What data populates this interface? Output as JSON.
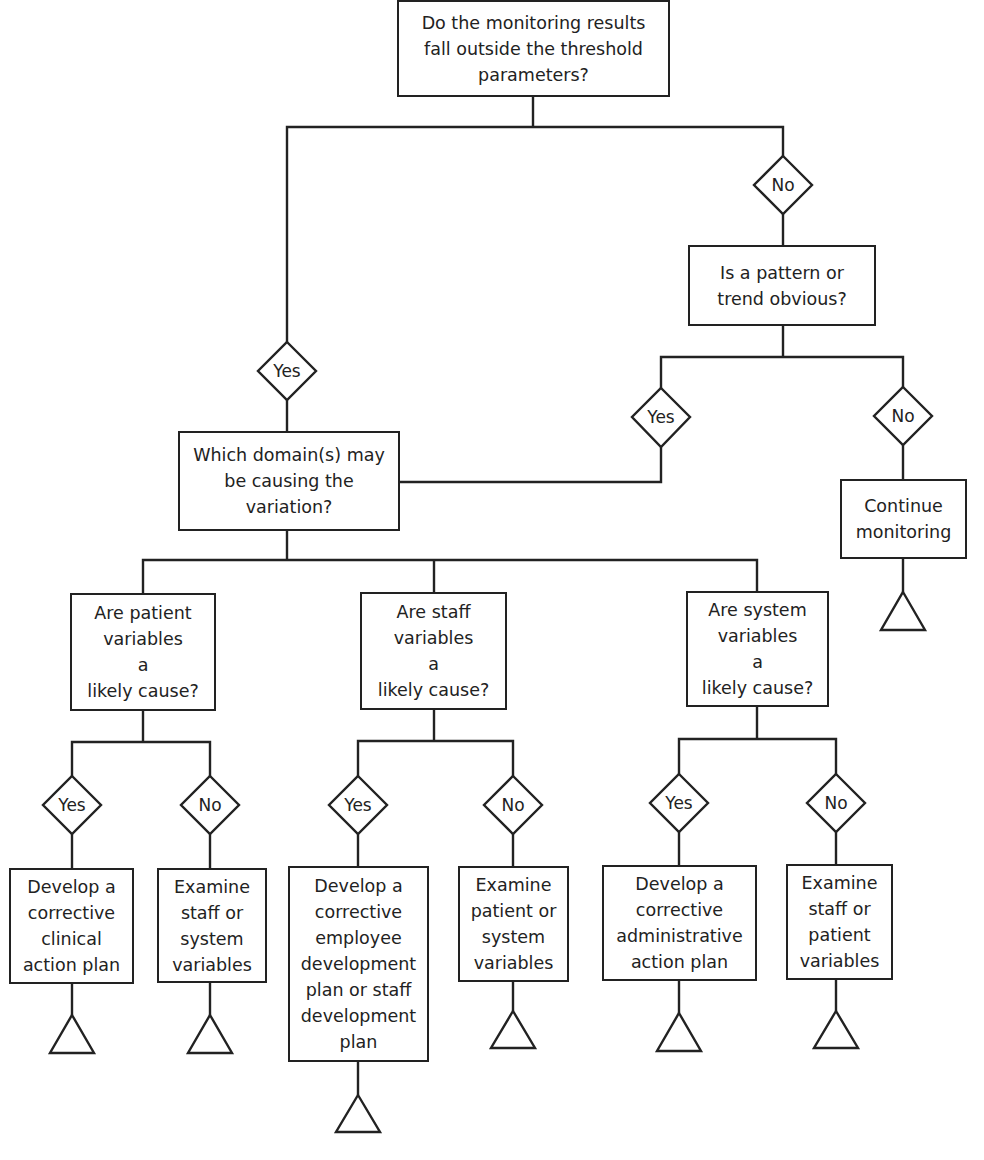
{
  "diagram": {
    "type": "decision-flowchart",
    "nodes": {
      "root": {
        "lines": [
          "Do the monitoring results",
          "fall outside the threshold",
          "parameters?"
        ]
      },
      "pattern": {
        "lines": [
          "Is a pattern or",
          "trend obvious?"
        ]
      },
      "domain": {
        "lines": [
          "Which domain(s) may",
          "be causing the",
          "variation?"
        ]
      },
      "continue": {
        "lines": [
          "Continue",
          "monitoring"
        ]
      },
      "patient_q": {
        "lines": [
          "Are patient",
          "variables",
          "a",
          "likely cause?"
        ]
      },
      "staff_q": {
        "lines": [
          "Are staff",
          "variables",
          "a",
          "likely cause?"
        ]
      },
      "system_q": {
        "lines": [
          "Are system",
          "variables",
          "a",
          "likely cause?"
        ]
      },
      "clinical_plan": {
        "lines": [
          "Develop a",
          "corrective",
          "clinical",
          "action plan"
        ]
      },
      "examine_staff_system": {
        "lines": [
          "Examine",
          "staff or",
          "system",
          "variables"
        ]
      },
      "employee_plan": {
        "lines": [
          "Develop a",
          "corrective",
          "employee",
          "development",
          "plan or staff",
          "development",
          "plan"
        ]
      },
      "examine_patient_system": {
        "lines": [
          "Examine",
          "patient or",
          "system",
          "variables"
        ]
      },
      "admin_plan": {
        "lines": [
          "Develop a",
          "corrective",
          "administrative",
          "action plan"
        ]
      },
      "examine_staff_patient": {
        "lines": [
          "Examine",
          "staff or",
          "patient",
          "variables"
        ]
      }
    },
    "decisions": {
      "root_yes": "Yes",
      "root_no": "No",
      "pattern_yes": "Yes",
      "pattern_no": "No",
      "patient_yes": "Yes",
      "patient_no": "No",
      "staff_yes": "Yes",
      "staff_no": "No",
      "system_yes": "Yes",
      "system_no": "No"
    },
    "edges": [
      [
        "root",
        "root_yes"
      ],
      [
        "root_yes",
        "domain"
      ],
      [
        "root",
        "root_no"
      ],
      [
        "root_no",
        "pattern"
      ],
      [
        "pattern",
        "pattern_yes"
      ],
      [
        "pattern_yes",
        "domain"
      ],
      [
        "pattern",
        "pattern_no"
      ],
      [
        "pattern_no",
        "continue"
      ],
      [
        "domain",
        "patient_q"
      ],
      [
        "domain",
        "staff_q"
      ],
      [
        "domain",
        "system_q"
      ],
      [
        "patient_q",
        "patient_yes"
      ],
      [
        "patient_yes",
        "clinical_plan"
      ],
      [
        "patient_q",
        "patient_no"
      ],
      [
        "patient_no",
        "examine_staff_system"
      ],
      [
        "staff_q",
        "staff_yes"
      ],
      [
        "staff_yes",
        "employee_plan"
      ],
      [
        "staff_q",
        "staff_no"
      ],
      [
        "staff_no",
        "examine_patient_system"
      ],
      [
        "system_q",
        "system_yes"
      ],
      [
        "system_yes",
        "admin_plan"
      ],
      [
        "system_q",
        "system_no"
      ],
      [
        "system_no",
        "examine_staff_patient"
      ]
    ],
    "terminal_symbol": "triangle-icon"
  }
}
